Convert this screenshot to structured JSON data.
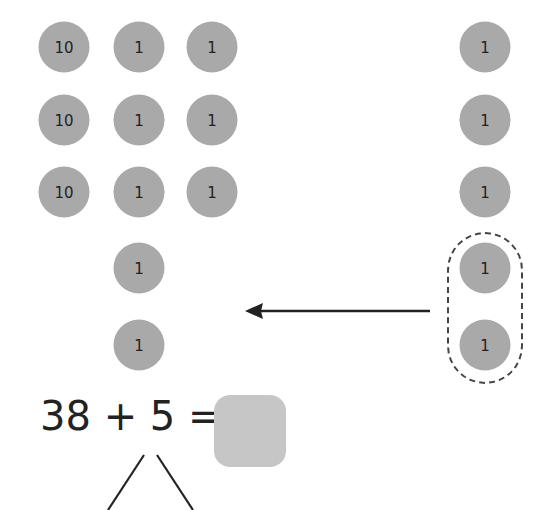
{
  "diagram": {
    "colors": {
      "counter_fill": "#a9a9a9",
      "counter_text": "#222222",
      "answer_box": "#c6c6c6",
      "lines": "#222222",
      "dashed_group": "#444444"
    },
    "left_group": {
      "counters": [
        {
          "label": "10",
          "x": 64,
          "y": 47
        },
        {
          "label": "1",
          "x": 139,
          "y": 47
        },
        {
          "label": "1",
          "x": 212,
          "y": 47
        },
        {
          "label": "10",
          "x": 64,
          "y": 120
        },
        {
          "label": "1",
          "x": 139,
          "y": 120
        },
        {
          "label": "1",
          "x": 212,
          "y": 120
        },
        {
          "label": "10",
          "x": 64,
          "y": 192
        },
        {
          "label": "1",
          "x": 139,
          "y": 192
        },
        {
          "label": "1",
          "x": 212,
          "y": 192
        },
        {
          "label": "1",
          "x": 139,
          "y": 268
        },
        {
          "label": "1",
          "x": 139,
          "y": 345
        }
      ]
    },
    "right_group": {
      "counters": [
        {
          "label": "1",
          "x": 485,
          "y": 47
        },
        {
          "label": "1",
          "x": 485,
          "y": 120
        },
        {
          "label": "1",
          "x": 485,
          "y": 192
        },
        {
          "label": "1",
          "x": 485,
          "y": 268
        },
        {
          "label": "1",
          "x": 485,
          "y": 345
        }
      ],
      "circled_group_note": "last two counters circled with dashed outline"
    },
    "arrow": {
      "direction": "left",
      "from_x": 430,
      "to_x": 245,
      "y": 311
    },
    "equation": {
      "text": "38 + 5 =",
      "addend1": "38",
      "operator": "+",
      "addend2": "5",
      "equals": "=",
      "answer": ""
    },
    "number_bond": {
      "parts": [
        "",
        ""
      ]
    }
  }
}
